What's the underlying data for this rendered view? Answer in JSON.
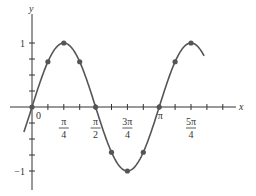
{
  "chart_data": {
    "type": "line",
    "title": "",
    "function": "y = sin 2x",
    "xlabel": "x",
    "ylabel": "y",
    "xlim": [
      -0.25,
      4.3
    ],
    "ylim": [
      -1.2,
      1.3
    ],
    "grid": false,
    "x_tick_labels": [
      {
        "value": 0,
        "num": "0",
        "den": ""
      },
      {
        "value": 0.7854,
        "num": "π",
        "den": "4"
      },
      {
        "value": 1.5708,
        "num": "π",
        "den": "2"
      },
      {
        "value": 2.3562,
        "num": "3π",
        "den": "4"
      },
      {
        "value": 3.1416,
        "num": "π",
        "den": ""
      },
      {
        "value": 3.927,
        "num": "5π",
        "den": "4"
      }
    ],
    "y_tick_labels": [
      {
        "value": 1,
        "label": "1"
      },
      {
        "value": -1,
        "label": "−1"
      }
    ],
    "marked_points": [
      {
        "x": 0,
        "y": 0
      },
      {
        "x": 0.3927,
        "y": 0.7071
      },
      {
        "x": 0.7854,
        "y": 1
      },
      {
        "x": 1.1781,
        "y": 0.7071
      },
      {
        "x": 1.5708,
        "y": 0
      },
      {
        "x": 1.9635,
        "y": -0.7071
      },
      {
        "x": 2.3562,
        "y": -1
      },
      {
        "x": 2.7489,
        "y": -0.7071
      },
      {
        "x": 3.1416,
        "y": 0
      },
      {
        "x": 3.5343,
        "y": 0.7071
      },
      {
        "x": 3.927,
        "y": 1
      }
    ],
    "curve_domain": [
      -0.2,
      4.25
    ],
    "colors": {
      "curve": "#555555",
      "axis": "#333333",
      "points": "#555555"
    }
  }
}
